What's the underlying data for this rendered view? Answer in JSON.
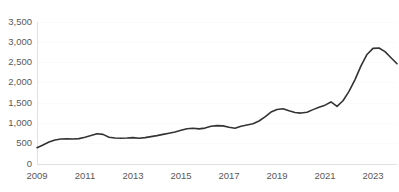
{
  "chart_data": {
    "type": "line",
    "title": "",
    "subtitle": "",
    "xlabel": "",
    "ylabel": "",
    "xlim": [
      2009.0,
      2024.0
    ],
    "ylim": [
      0,
      3500
    ],
    "grid": true,
    "grid_axis": "y",
    "legend": false,
    "legend_position": "none",
    "line_color": "#333333",
    "tick_label_color": "#595959",
    "background_color": "#ffffff",
    "ytick_labels": [
      "0",
      "500",
      "1,000",
      "1,500",
      "2,000",
      "2,500",
      "3,000",
      "3,500"
    ],
    "ytick_values": [
      0,
      500,
      1000,
      1500,
      2000,
      2500,
      3000,
      3500
    ],
    "xtick_labels": [
      "2009",
      "2011",
      "2013",
      "2015",
      "2017",
      "2019",
      "2021",
      "2023"
    ],
    "xtick_values": [
      2009,
      2011,
      2013,
      2015,
      2017,
      2019,
      2021,
      2023
    ],
    "series": [
      {
        "name": "series-1",
        "x": [
          2009.0,
          2009.25,
          2009.5,
          2009.75,
          2010.0,
          2010.25,
          2010.5,
          2010.75,
          2011.0,
          2011.25,
          2011.5,
          2011.75,
          2012.0,
          2012.25,
          2012.5,
          2012.75,
          2013.0,
          2013.25,
          2013.5,
          2013.75,
          2014.0,
          2014.25,
          2014.5,
          2014.75,
          2015.0,
          2015.25,
          2015.5,
          2015.75,
          2016.0,
          2016.25,
          2016.5,
          2016.75,
          2017.0,
          2017.25,
          2017.5,
          2017.75,
          2018.0,
          2018.25,
          2018.5,
          2018.75,
          2019.0,
          2019.25,
          2019.5,
          2019.75,
          2020.0,
          2020.25,
          2020.5,
          2020.75,
          2021.0,
          2021.25,
          2021.5,
          2021.75,
          2022.0,
          2022.25,
          2022.5,
          2022.75,
          2023.0,
          2023.25,
          2023.5,
          2023.75,
          2024.0
        ],
        "values": [
          400,
          470,
          540,
          590,
          615,
          620,
          615,
          625,
          660,
          700,
          745,
          730,
          660,
          640,
          635,
          640,
          650,
          635,
          650,
          675,
          700,
          730,
          760,
          790,
          830,
          870,
          880,
          865,
          885,
          930,
          945,
          940,
          905,
          880,
          930,
          960,
          990,
          1060,
          1160,
          1280,
          1345,
          1360,
          1310,
          1270,
          1255,
          1275,
          1340,
          1400,
          1450,
          1530,
          1420,
          1560,
          1790,
          2080,
          2420,
          2700,
          2850,
          2860,
          2770,
          2620,
          2470
        ]
      }
    ],
    "annotations": []
  }
}
